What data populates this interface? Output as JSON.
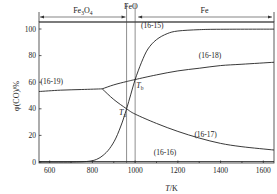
{
  "chart_data": {
    "type": "line",
    "title": "",
    "xlabel": "T/K",
    "xlabel_parts": {
      "var": "T",
      "unit": "/K"
    },
    "ylabel": "φ(CO)/%",
    "xlim": [
      550,
      1650
    ],
    "ylim": [
      0,
      105
    ],
    "x_ticks": [
      600,
      800,
      1000,
      1200,
      1400,
      1600
    ],
    "y_ticks": [
      0,
      20,
      40,
      60,
      80,
      100
    ],
    "grid": false,
    "phase_regions": [
      {
        "label": "Fe3O4",
        "label_main": "Fe",
        "label_sub1": "3",
        "label_mid": "O",
        "label_sub2": "4",
        "from": 550,
        "to": 960
      },
      {
        "label": "FeO",
        "from": 960,
        "to": 1000
      },
      {
        "label": "Fe",
        "from": 1000,
        "to": 1650
      }
    ],
    "vertical_lines": [
      960,
      1000
    ],
    "series": [
      {
        "name": "(16-15)",
        "x": [
          550,
          700,
          780,
          820,
          850,
          880,
          910,
          940,
          960,
          980,
          1000,
          1030,
          1060,
          1100,
          1150,
          1200,
          1300,
          1400,
          1650
        ],
        "values": [
          0,
          0,
          0.5,
          2,
          5,
          10,
          18,
          30,
          40,
          51,
          62,
          75,
          85,
          92,
          96.5,
          98.5,
          99.5,
          99.8,
          99.9
        ]
      },
      {
        "name": "(16-16)",
        "x": [
          550,
          1650
        ],
        "values": [
          0.3,
          0.3
        ]
      },
      {
        "name": "(16-17)",
        "x": [
          846,
          900,
          960,
          1000,
          1100,
          1200,
          1300,
          1400,
          1500,
          1650
        ],
        "values": [
          55,
          47,
          40,
          36,
          29,
          23,
          18,
          14,
          11.5,
          9
        ]
      },
      {
        "name": "(16-18)",
        "x": [
          846,
          900,
          960,
          1000,
          1100,
          1200,
          1300,
          1400,
          1500,
          1650
        ],
        "values": [
          55,
          58,
          60.5,
          62,
          65.5,
          68.5,
          70.5,
          72.5,
          73.5,
          75
        ]
      },
      {
        "name": "(16-19)",
        "x": [
          550,
          650,
          750,
          846
        ],
        "values": [
          53,
          54,
          54.5,
          55
        ]
      }
    ],
    "annotations": [
      {
        "text": "(16-15)",
        "x": 1080,
        "y": 101
      },
      {
        "text": "(16-18)",
        "x": 1350,
        "y": 78
      },
      {
        "text": "(16-19)",
        "x": 610,
        "y": 59
      },
      {
        "text": "(16-17)",
        "x": 1330,
        "y": 19
      },
      {
        "text": "(16-16)",
        "x": 1140,
        "y": 5
      },
      {
        "text": "Ta",
        "main": "T",
        "sub": "a",
        "x": 925,
        "y": 35
      },
      {
        "text": "Tb",
        "main": "T",
        "sub": "b",
        "x": 1005,
        "y": 56
      }
    ]
  }
}
